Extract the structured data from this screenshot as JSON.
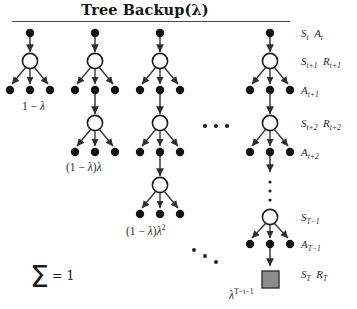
{
  "figure": {
    "title": "Tree Backup(λ)",
    "background_color": "#ffffff",
    "node_color": "#111111",
    "circle_fill": "#ffffff",
    "terminal_fill": "#8c8c8c",
    "terminal_stroke": "#333333",
    "edge_color": "#3a3a3a"
  },
  "right_labels": [
    {
      "id": "state-action-t",
      "text": "St At",
      "html": "S<sub>t</sub> A<sub>t</sub>"
    },
    {
      "id": "state-reward-t1",
      "text": "St+1 Rt+1",
      "html": "S<sub>t+1</sub> R<sub>t+1</sub>"
    },
    {
      "id": "action-t1",
      "text": "At+1",
      "html": "A<sub>t+1</sub>"
    },
    {
      "id": "state-reward-t2",
      "text": "St+2 Rt+2",
      "html": "S<sub>t+2</sub> R<sub>t+2</sub>"
    },
    {
      "id": "action-t2",
      "text": "At+2",
      "html": "A<sub>t+2</sub>"
    },
    {
      "id": "state-T1",
      "text": "ST-1",
      "html": "S<sub>T−1</sub>"
    },
    {
      "id": "action-T1",
      "text": "AT-1",
      "html": "A<sub>T−1</sub>"
    },
    {
      "id": "state-reward-T",
      "text": "ST RT",
      "html": "S<sub>T</sub> R<sub>T</sub>"
    }
  ],
  "weight_labels": [
    {
      "id": "weight-1",
      "text": "1 − λ",
      "html": "1 − <span class=\"it\">λ</span>"
    },
    {
      "id": "weight-2",
      "text": "(1 − λ)λ",
      "html": "(1 − <span class=\"it\">λ</span>)<span class=\"it\">λ</span>"
    },
    {
      "id": "weight-3",
      "text": "(1 − λ)λ²",
      "html": "(1 − <span class=\"it\">λ</span>)<span class=\"it\">λ</span><sup>2</sup>"
    },
    {
      "id": "weight-terminal",
      "text": "λ^(T−t−1)",
      "html": "<span class=\"it\">λ</span><sup>T−t−1</sup>"
    }
  ],
  "sum_annotation": {
    "sigma": "Σ",
    "equals_value": "= 1"
  },
  "ellipses": {
    "horizontal": "···",
    "diagonal": "···",
    "vertical": "···"
  },
  "chart_data": {
    "type": "diagram",
    "title": "Tree Backup(λ)",
    "columns": [
      {
        "index": 1,
        "center_x": 30,
        "levels": 1,
        "weight": "1 − λ",
        "terminal": false
      },
      {
        "index": 2,
        "center_x": 95,
        "levels": 2,
        "weight": "(1 − λ)λ",
        "terminal": false
      },
      {
        "index": 3,
        "center_x": 160,
        "levels": 3,
        "weight": "(1 − λ)λ²",
        "terminal": false
      },
      {
        "index": 4,
        "center_x": 270,
        "levels": 3,
        "weight": "λ^(T−t−1)",
        "terminal": true
      }
    ],
    "node_types": [
      "state-action-dot",
      "state-circle",
      "terminal-square"
    ],
    "weights_sum": "1"
  }
}
